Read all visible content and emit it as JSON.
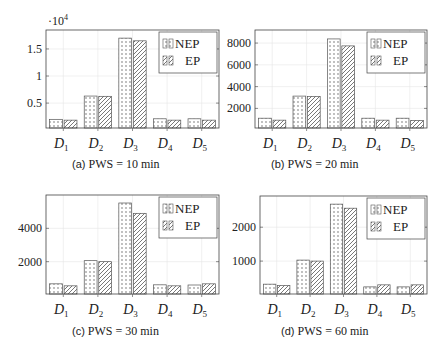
{
  "chart_data": [
    {
      "id": "a",
      "type": "bar",
      "title": "(a) PWS = 10 min",
      "caption_label": "(a)",
      "caption_text": "PWS = 10 min",
      "categories": [
        "D1",
        "D2",
        "D3",
        "D4",
        "D5"
      ],
      "series": [
        {
          "name": "NEP",
          "pattern": "dots",
          "values": [
            2000,
            6300,
            17000,
            2100,
            2100
          ]
        },
        {
          "name": "EP",
          "pattern": "hatch",
          "values": [
            1850,
            6250,
            16500,
            1850,
            1850
          ]
        }
      ],
      "y_scale_label": "·10^4",
      "yticks": [
        0.5,
        1,
        1.5
      ],
      "ytick_labels": [
        "0.5",
        "1",
        "1.5"
      ],
      "ytick_multiplier": 10000,
      "ylim": [
        400,
        18500
      ],
      "xlabel": "",
      "ylabel": "",
      "grid": true,
      "legend_position": "upper right"
    },
    {
      "id": "b",
      "type": "bar",
      "title": "(b) PWS = 20 min",
      "caption_label": "(b)",
      "caption_text": "PWS = 20 min",
      "categories": [
        "D1",
        "D2",
        "D3",
        "D4",
        "D5"
      ],
      "series": [
        {
          "name": "NEP",
          "pattern": "dots",
          "values": [
            1100,
            3130,
            8380,
            1100,
            1100
          ]
        },
        {
          "name": "EP",
          "pattern": "hatch",
          "values": [
            920,
            3100,
            7740,
            920,
            900
          ]
        }
      ],
      "yticks": [
        2000,
        4000,
        6000,
        8000
      ],
      "ytick_labels": [
        "2000",
        "4000",
        "6000",
        "8000"
      ],
      "ytick_multiplier": 1,
      "ylim": [
        200,
        9200
      ],
      "xlabel": "",
      "ylabel": "",
      "grid": true,
      "legend_position": "upper right"
    },
    {
      "id": "c",
      "type": "bar",
      "title": "(c) PWS = 30 min",
      "caption_label": "(c)",
      "caption_text": "PWS = 30 min",
      "categories": [
        "D1",
        "D2",
        "D3",
        "D4",
        "D5"
      ],
      "series": [
        {
          "name": "NEP",
          "pattern": "dots",
          "values": [
            670,
            2060,
            5520,
            610,
            600
          ]
        },
        {
          "name": "EP",
          "pattern": "hatch",
          "values": [
            550,
            2000,
            4900,
            550,
            670
          ]
        }
      ],
      "yticks": [
        2000,
        4000
      ],
      "ytick_labels": [
        "2000",
        "4000"
      ],
      "ytick_multiplier": 1,
      "ylim": [
        60,
        6000
      ],
      "xlabel": "",
      "ylabel": "",
      "grid": true,
      "legend_position": "upper right"
    },
    {
      "id": "d",
      "type": "bar",
      "title": "(d) PWS = 60 min",
      "caption_label": "(d)",
      "caption_text": "PWS = 60 min",
      "categories": [
        "D1",
        "D2",
        "D3",
        "D4",
        "D5"
      ],
      "series": [
        {
          "name": "NEP",
          "pattern": "dots",
          "values": [
            320,
            1030,
            2680,
            240,
            240
          ]
        },
        {
          "name": "EP",
          "pattern": "hatch",
          "values": [
            280,
            1000,
            2560,
            300,
            300
          ]
        }
      ],
      "yticks": [
        1000,
        2000
      ],
      "ytick_labels": [
        "1000",
        "2000"
      ],
      "ytick_multiplier": 1,
      "ylim": [
        30,
        2920
      ],
      "xlabel": "",
      "ylabel": "",
      "grid": true,
      "legend_position": "upper right"
    }
  ],
  "layout": {
    "panels": [
      {
        "left": 46,
        "top": 30,
        "width": 173,
        "height": 98,
        "caption_x": 72,
        "caption_y": 157
      },
      {
        "left": 255,
        "top": 30,
        "width": 172,
        "height": 98,
        "caption_x": 271,
        "caption_y": 157
      },
      {
        "left": 46,
        "top": 195,
        "width": 173,
        "height": 99,
        "caption_x": 72,
        "caption_y": 324
      },
      {
        "left": 260,
        "top": 196,
        "width": 167,
        "height": 98,
        "caption_x": 281,
        "caption_y": 324
      }
    ],
    "colors": {
      "axis": "#444444",
      "bar_stroke": "#555555",
      "pattern": "#555555",
      "grid": "#e6e6e6",
      "text": "#222222"
    }
  }
}
